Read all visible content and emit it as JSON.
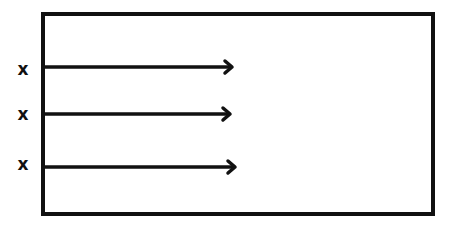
{
  "diagram": {
    "title": "",
    "colors": {
      "stroke": "#111111",
      "background": "#ffffff"
    },
    "box": {
      "x": 43,
      "y": 14,
      "width": 390,
      "height": 200
    },
    "rows": [
      {
        "marker": "x",
        "marker_x": 23,
        "marker_y": 69,
        "arrow_y": 67,
        "arrow_start_x": 45,
        "arrow_end_x": 232
      },
      {
        "marker": "x",
        "marker_x": 23,
        "marker_y": 114,
        "arrow_y": 114,
        "arrow_start_x": 45,
        "arrow_end_x": 230
      },
      {
        "marker": "x",
        "marker_x": 23,
        "marker_y": 164,
        "arrow_y": 167,
        "arrow_start_x": 45,
        "arrow_end_x": 235
      }
    ]
  }
}
